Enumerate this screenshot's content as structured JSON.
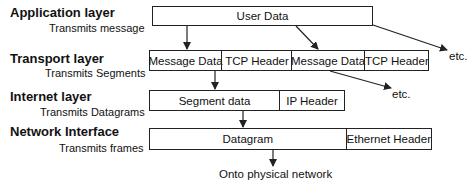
{
  "layers": [
    {
      "title": "Application layer",
      "subtitle": "Transmits message"
    },
    {
      "title": "Transport layer",
      "subtitle": "Transmits Segments"
    },
    {
      "title": "Internet layer",
      "subtitle": "Transmits Datagrams"
    },
    {
      "title": "Network Interface",
      "subtitle": "Transmits frames"
    }
  ],
  "application": {
    "user_data": "User Data"
  },
  "transport": [
    {
      "data": "Message Data",
      "header": "TCP Header"
    },
    {
      "data": "Message Data",
      "header": "TCP Header"
    }
  ],
  "internet": {
    "data": "Segment data",
    "header": "IP Header"
  },
  "network": {
    "data": "Datagram",
    "header": "Ethernet Header"
  },
  "etc_labels": [
    "etc.",
    "etc."
  ],
  "bottom_label": "Onto physical network",
  "colors": {
    "line": "#222222",
    "background": "#ffffff"
  }
}
